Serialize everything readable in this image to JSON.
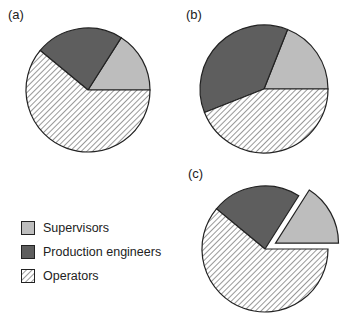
{
  "chart_data": [
    {
      "type": "pie",
      "panel": "(a)",
      "categories": [
        "Supervisors",
        "Production engineers",
        "Operators"
      ],
      "values": [
        16,
        23,
        61
      ],
      "start_angle_deg": 0,
      "direction": "counterclockwise",
      "exploded": []
    },
    {
      "type": "pie",
      "panel": "(b)",
      "categories": [
        "Supervisors",
        "Production engineers",
        "Operators"
      ],
      "values": [
        19,
        37,
        44
      ],
      "start_angle_deg": 0,
      "direction": "counterclockwise",
      "exploded": []
    },
    {
      "type": "pie",
      "panel": "(c)",
      "categories": [
        "Supervisors",
        "Production engineers",
        "Operators"
      ],
      "values": [
        16,
        23,
        61
      ],
      "start_angle_deg": 0,
      "direction": "counterclockwise",
      "exploded": [
        "Supervisors"
      ]
    }
  ],
  "panels": [
    {
      "label": "(a)",
      "cx": 88,
      "cy": 90,
      "r": 62
    },
    {
      "label": "(b)",
      "cx": 264,
      "cy": 89,
      "r": 64
    },
    {
      "label": "(c)",
      "cx": 265,
      "cy": 249,
      "r": 63
    }
  ],
  "legend": {
    "items": [
      {
        "label": "Supervisors",
        "fill": "#bdbdbd",
        "pattern": "solid"
      },
      {
        "label": "Production engineers",
        "fill": "#5e5e5e",
        "pattern": "solid"
      },
      {
        "label": "Operators",
        "fill": "#ffffff",
        "pattern": "hatch"
      }
    ]
  },
  "colors": {
    "supervisors": "#bdbdbd",
    "engineers": "#5e5e5e",
    "hatch_line": "#333333",
    "outline": "#222222"
  }
}
